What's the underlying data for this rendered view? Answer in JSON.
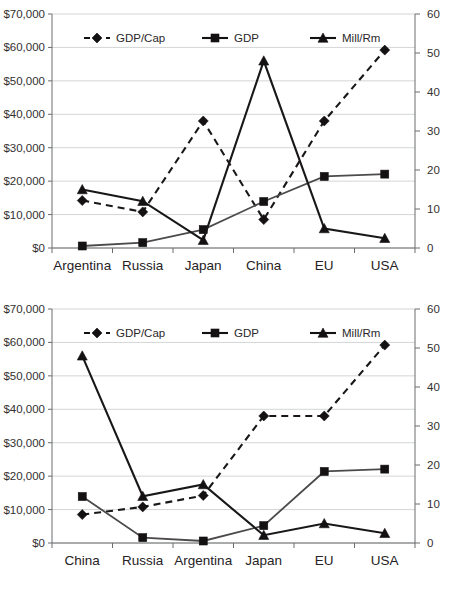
{
  "page": {
    "background_color": "#ffffff"
  },
  "legend": {
    "items": [
      {
        "label": "GDP/Cap",
        "marker": "diamond-icon",
        "line_style": "dashed",
        "color": "#141112"
      },
      {
        "label": "GDP",
        "marker": "square-icon",
        "line_style": "solid",
        "color": "#141112"
      },
      {
        "label": "Mill/Rm",
        "marker": "triangle-icon",
        "line_style": "solid",
        "color": "#141112"
      }
    ]
  },
  "axes": {
    "left_ticks": [
      "$0",
      "$10,000",
      "$20,000",
      "$30,000",
      "$40,000",
      "$50,000",
      "$60,000",
      "$70,000"
    ],
    "right_ticks": [
      "0",
      "10",
      "20",
      "30",
      "40",
      "50",
      "60"
    ]
  },
  "chart_data": [
    {
      "id": "chart-top",
      "type": "line",
      "title": "",
      "xlabel": "",
      "ylabel": "",
      "y2label": "",
      "categories": [
        "Argentina",
        "Russia",
        "Japan",
        "China",
        "EU",
        "USA"
      ],
      "ylim": [
        0,
        70000
      ],
      "y2lim": [
        0,
        60
      ],
      "grid": true,
      "legend_position": "top-inside",
      "series": [
        {
          "name": "GDP/Cap",
          "axis": "left",
          "style": "dashed",
          "marker": "diamond",
          "values": [
            14200,
            10800,
            38000,
            8500,
            38000,
            59200
          ]
        },
        {
          "name": "GDP",
          "axis": "left",
          "style": "solid",
          "marker": "square",
          "values": [
            600,
            1600,
            5500,
            13900,
            21400,
            22100
          ]
        },
        {
          "name": "Mill/Rm",
          "axis": "right",
          "style": "solid",
          "marker": "triangle",
          "values": [
            15,
            12,
            2,
            48,
            5,
            2.5
          ]
        }
      ]
    },
    {
      "id": "chart-bottom",
      "type": "line",
      "title": "",
      "xlabel": "",
      "ylabel": "",
      "y2label": "",
      "categories": [
        "China",
        "Russia",
        "Argentina",
        "Japan",
        "EU",
        "USA"
      ],
      "ylim": [
        0,
        70000
      ],
      "y2lim": [
        0,
        60
      ],
      "grid": true,
      "legend_position": "top-inside",
      "series": [
        {
          "name": "GDP/Cap",
          "axis": "left",
          "style": "dashed",
          "marker": "diamond",
          "values": [
            8500,
            10800,
            14200,
            38000,
            38000,
            59200
          ]
        },
        {
          "name": "GDP",
          "axis": "left",
          "style": "solid",
          "marker": "square",
          "values": [
            13900,
            1600,
            600,
            5200,
            21400,
            22100
          ]
        },
        {
          "name": "Mill/Rm",
          "axis": "right",
          "style": "solid",
          "marker": "triangle",
          "values": [
            48,
            12,
            15,
            2,
            5,
            2.5
          ]
        }
      ]
    }
  ]
}
